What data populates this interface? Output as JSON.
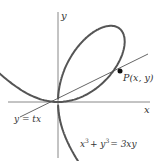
{
  "figure": {
    "axes": {
      "x_label": "x",
      "y_label": "y"
    },
    "curve": {
      "equation": "x³ + y³ = 3xy",
      "eq_parts": {
        "a": "x",
        "b": "+ y",
        "c": "= 3xy",
        "exp": "3"
      }
    },
    "line": {
      "label": "y = tx"
    },
    "point": {
      "label": "P(x, y)"
    },
    "colors": {
      "curve": "#555555",
      "axis": "#888888",
      "line": "#666666",
      "point": "#111111",
      "text": "#333333"
    }
  }
}
